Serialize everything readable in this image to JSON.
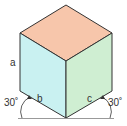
{
  "diagram": {
    "labels": {
      "a": "a",
      "b": "b",
      "c": "c",
      "angle_left": "30˚",
      "angle_right": "30˚"
    },
    "colors": {
      "top_face": "#f7c6ab",
      "left_face": "#c9f1f1",
      "right_face": "#cfeed2",
      "edge": "#333333",
      "baseline": "#999999"
    }
  }
}
